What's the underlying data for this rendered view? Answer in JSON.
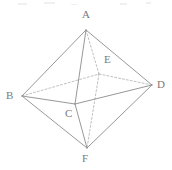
{
  "figure": {
    "type": "geometric-solid-diagram",
    "canvas": {
      "width": 172,
      "height": 170,
      "background": "#ffffff"
    },
    "style": {
      "solid_edge_color": "#8c8c8c",
      "hidden_edge_color": "#b0b0b0",
      "label_color": "#7a7a7a",
      "solid_edge_width": 0.9,
      "hidden_edge_width": 0.8,
      "hidden_dash_pattern": "2,2"
    },
    "vertices": [
      {
        "id": "A",
        "label": "A",
        "x": 86,
        "y": 30,
        "label_x": 82,
        "label_y": 9,
        "role": "top-apex"
      },
      {
        "id": "B",
        "label": "B",
        "x": 22,
        "y": 96,
        "label_x": 6,
        "label_y": 90,
        "role": "base-left"
      },
      {
        "id": "C",
        "label": "C",
        "x": 75,
        "y": 104,
        "label_x": 65,
        "label_y": 108,
        "role": "base-front"
      },
      {
        "id": "D",
        "label": "D",
        "x": 152,
        "y": 85,
        "label_x": 157,
        "label_y": 79,
        "role": "base-right"
      },
      {
        "id": "E",
        "label": "E",
        "x": 99,
        "y": 74,
        "label_x": 104,
        "label_y": 54,
        "role": "base-back-hidden"
      },
      {
        "id": "F",
        "label": "F",
        "x": 87,
        "y": 148,
        "label_x": 82,
        "label_y": 153,
        "role": "bottom-apex"
      }
    ],
    "edges_solid": [
      {
        "from": "A",
        "to": "B"
      },
      {
        "from": "A",
        "to": "D"
      },
      {
        "from": "A",
        "to": "C"
      },
      {
        "from": "B",
        "to": "C"
      },
      {
        "from": "C",
        "to": "D"
      },
      {
        "from": "B",
        "to": "F"
      },
      {
        "from": "C",
        "to": "F"
      },
      {
        "from": "D",
        "to": "F"
      }
    ],
    "edges_hidden": [
      {
        "from": "A",
        "to": "E"
      },
      {
        "from": "B",
        "to": "E"
      },
      {
        "from": "E",
        "to": "D"
      },
      {
        "from": "E",
        "to": "F"
      }
    ],
    "scan_artifacts": [
      {
        "x": 18,
        "y": 3,
        "w": 9,
        "h": 2
      },
      {
        "x": 44,
        "y": 2,
        "w": 11,
        "h": 2
      },
      {
        "x": 71,
        "y": 4,
        "w": 6,
        "h": 1
      },
      {
        "x": 120,
        "y": 3,
        "w": 7,
        "h": 2
      },
      {
        "x": 146,
        "y": 2,
        "w": 5,
        "h": 2
      }
    ]
  }
}
